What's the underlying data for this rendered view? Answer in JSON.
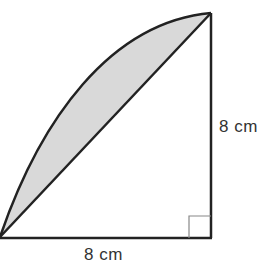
{
  "figure": {
    "labels": {
      "vertical_side": "8 cm",
      "horizontal_side": "8 cm"
    },
    "colors": {
      "stroke": "#222222",
      "shade": "#d9d9d9",
      "right_angle_marker": "#888888"
    }
  }
}
